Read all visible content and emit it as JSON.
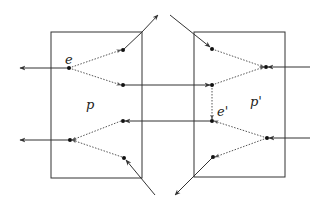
{
  "diagram": {
    "type": "network-flow",
    "colors": {
      "stroke": "#333333",
      "dotted": "#555555",
      "node": "#111111",
      "background": "#ffffff"
    },
    "boxes": [
      {
        "id": "p",
        "label": "p",
        "x": 51,
        "y": 32,
        "w": 91,
        "h": 146
      },
      {
        "id": "p_prime",
        "label": "p'",
        "x": 194,
        "y": 32,
        "w": 91,
        "h": 145
      }
    ],
    "labels": {
      "e": "e",
      "e_prime": "e'",
      "p": "p",
      "p_prime": "p'"
    },
    "nodes": [
      {
        "id": "e",
        "x": 69,
        "y": 68,
        "label": "e"
      },
      {
        "id": "l1",
        "x": 123,
        "y": 50
      },
      {
        "id": "l2",
        "x": 123,
        "y": 85
      },
      {
        "id": "l3",
        "x": 123,
        "y": 121
      },
      {
        "id": "l4",
        "x": 70,
        "y": 140
      },
      {
        "id": "l5",
        "x": 124,
        "y": 158
      },
      {
        "id": "r1",
        "x": 212,
        "y": 49
      },
      {
        "id": "r2",
        "x": 266,
        "y": 67
      },
      {
        "id": "r3",
        "x": 212,
        "y": 85
      },
      {
        "id": "e_prime",
        "x": 212,
        "y": 121,
        "label": "e'"
      },
      {
        "id": "r5",
        "x": 267,
        "y": 138
      },
      {
        "id": "r6",
        "x": 213,
        "y": 157
      }
    ],
    "solid_edges": [
      {
        "from": [
          69,
          68
        ],
        "to": [
          20,
          68
        ],
        "arrow": "end"
      },
      {
        "from": [
          123,
          50
        ],
        "to": [
          158,
          15
        ],
        "arrow": "end",
        "via": [
          142,
          32
        ]
      },
      {
        "from": [
          123,
          85
        ],
        "to": [
          210,
          85
        ],
        "arrow": "end"
      },
      {
        "from": [
          212,
          121
        ],
        "to": [
          125,
          121
        ],
        "arrow": "end"
      },
      {
        "from": [
          70,
          140
        ],
        "to": [
          20,
          140
        ],
        "arrow": "end"
      },
      {
        "from": [
          155,
          195
        ],
        "to": [
          126,
          160
        ],
        "arrow": "end"
      },
      {
        "from": [
          170,
          15
        ],
        "to": [
          210,
          47
        ],
        "arrow": "end"
      },
      {
        "from": [
          310,
          67
        ],
        "to": [
          268,
          67
        ],
        "arrow": "end"
      },
      {
        "from": [
          310,
          138
        ],
        "to": [
          269,
          138
        ],
        "arrow": "end"
      },
      {
        "from": [
          213,
          157
        ],
        "to": [
          175,
          195
        ],
        "arrow": "end"
      }
    ],
    "dotted_edges": [
      {
        "from": [
          69,
          68
        ],
        "to": [
          121,
          50
        ],
        "arrow": "end"
      },
      {
        "from": [
          69,
          68
        ],
        "to": [
          121,
          85
        ],
        "arrow": "end"
      },
      {
        "from": [
          121,
          121
        ],
        "to": [
          72,
          140
        ],
        "arrow": "end"
      },
      {
        "from": [
          122,
          157
        ],
        "to": [
          72,
          140
        ],
        "arrow": "end"
      },
      {
        "from": [
          212,
          49
        ],
        "to": [
          264,
          67
        ],
        "arrow": "end"
      },
      {
        "from": [
          212,
          85
        ],
        "to": [
          264,
          67
        ],
        "arrow": "end"
      },
      {
        "from": [
          212,
          85
        ],
        "to": [
          212,
          119
        ],
        "arrow": "end"
      },
      {
        "from": [
          267,
          138
        ],
        "to": [
          214,
          121
        ],
        "arrow": "end"
      },
      {
        "from": [
          267,
          138
        ],
        "to": [
          215,
          157
        ],
        "arrow": "end"
      }
    ]
  }
}
